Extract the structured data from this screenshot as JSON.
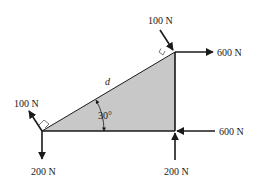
{
  "diagram": {
    "type": "free-body-diagram",
    "colors": {
      "background": "#ffffff",
      "triangle_fill": "#c8c8c8",
      "stroke": "#1a1a1a"
    },
    "triangle": {
      "vertices": {
        "bottom_left": [
          42,
          131
        ],
        "bottom_right": [
          175,
          131
        ],
        "top_right": [
          175,
          52
        ]
      },
      "hypotenuse_label": "d",
      "angle_label": "30°"
    },
    "forces": [
      {
        "id": "top-normal",
        "label": "100 N",
        "direction": "down-right, perpendicular to hypotenuse",
        "at": "top_right"
      },
      {
        "id": "top-horizontal",
        "label": "600 N",
        "direction": "right",
        "at": "top_right"
      },
      {
        "id": "bottom-right-horizontal",
        "label": "600 N",
        "direction": "left",
        "at": "bottom_right"
      },
      {
        "id": "bottom-right-vertical",
        "label": "200 N",
        "direction": "up",
        "at": "bottom_right"
      },
      {
        "id": "bottom-left-normal",
        "label": "100 N",
        "direction": "up-left, perpendicular to hypotenuse",
        "at": "bottom_left"
      },
      {
        "id": "bottom-left-vertical",
        "label": "200 N",
        "direction": "down",
        "at": "bottom_left"
      }
    ]
  }
}
